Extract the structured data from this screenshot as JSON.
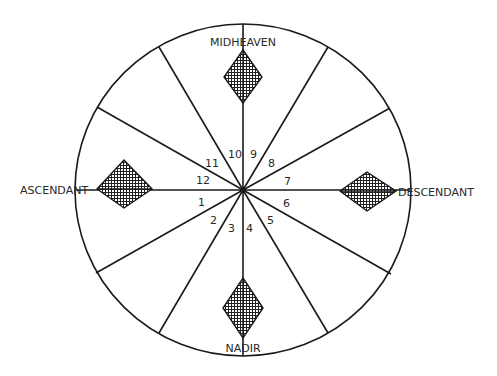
{
  "diagram": {
    "type": "astrological-house-wheel",
    "center": {
      "x": 243,
      "y": 190
    },
    "radius": {
      "rx": 168,
      "ry": 166
    },
    "colors": {
      "stroke": "#1a1a1a",
      "background": "#ffffff",
      "hatch": "#222222"
    },
    "angles": {
      "midheaven": "MIDHEAVEN",
      "ascendant": "ASCENDANT",
      "descendant": "DESCENDANT",
      "nadir": "NADIR"
    },
    "houses": [
      {
        "number": "1",
        "x": 198,
        "y": 206
      },
      {
        "number": "2",
        "x": 210,
        "y": 224
      },
      {
        "number": "3",
        "x": 228,
        "y": 232
      },
      {
        "number": "4",
        "x": 246,
        "y": 232
      },
      {
        "number": "5",
        "x": 267,
        "y": 224
      },
      {
        "number": "6",
        "x": 283,
        "y": 207
      },
      {
        "number": "7",
        "x": 284,
        "y": 185
      },
      {
        "number": "8",
        "x": 268,
        "y": 167
      },
      {
        "number": "9",
        "x": 250,
        "y": 158
      },
      {
        "number": "10",
        "x": 228,
        "y": 158
      },
      {
        "number": "11",
        "x": 205,
        "y": 167
      },
      {
        "number": "12",
        "x": 196,
        "y": 184
      }
    ]
  }
}
